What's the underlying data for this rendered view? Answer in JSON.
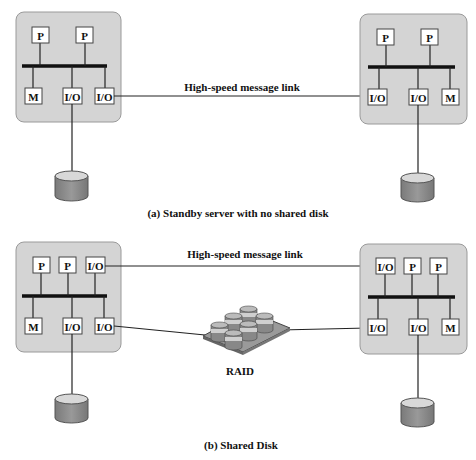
{
  "diagram": {
    "colors": {
      "server_fill": "#d4d4d4",
      "server_stroke": "#9a9a9a",
      "disk_body": "#8a8a8a",
      "disk_top": "#d8d8d8",
      "bus": "#111111",
      "line": "#222222"
    },
    "part_a": {
      "caption": "(a) Standby server with no shared disk",
      "link_label": "High-speed message link",
      "left_server": {
        "top_row": [
          "P",
          "P"
        ],
        "bottom_row": [
          "M",
          "I/O",
          "I/O"
        ]
      },
      "right_server": {
        "top_row": [
          "P",
          "P"
        ],
        "bottom_row": [
          "I/O",
          "I/O",
          "M"
        ]
      }
    },
    "part_b": {
      "caption": "(b) Shared Disk",
      "link_label": "High-speed message link",
      "raid_label": "RAID",
      "left_server": {
        "top_row": [
          "P",
          "P",
          "I/O"
        ],
        "bottom_row": [
          "M",
          "I/O",
          "I/O"
        ]
      },
      "right_server": {
        "top_row": [
          "I/O",
          "P",
          "P"
        ],
        "bottom_row": [
          "I/O",
          "I/O",
          "M"
        ]
      }
    }
  }
}
